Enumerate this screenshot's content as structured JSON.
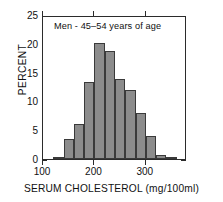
{
  "chart_data": {
    "type": "bar",
    "title": "Men - 45–54 years of age",
    "subtitle": "",
    "xlabel": "SERUM CHOLESTEROL (mg/100ml)",
    "ylabel": "PERCENT",
    "xlim": [
      100,
      380
    ],
    "ylim": [
      0,
      25
    ],
    "grid": false,
    "legend": "none",
    "bin_width": 20,
    "xticks": [
      {
        "value": 100,
        "label": "100"
      },
      {
        "value": 200,
        "label": "200"
      },
      {
        "value": 300,
        "label": "300"
      }
    ],
    "yticks": [
      {
        "value": 0,
        "label": "0"
      },
      {
        "value": 5,
        "label": "5"
      },
      {
        "value": 10,
        "label": "10"
      },
      {
        "value": 15,
        "label": "15"
      },
      {
        "value": 20,
        "label": "20"
      },
      {
        "value": 25,
        "label": "25"
      }
    ],
    "bar_color": "#8c8c8c",
    "bar_edge_color": "#3a3a3a",
    "categories": [
      "120–140",
      "140–160",
      "160–180",
      "180–200",
      "200–220",
      "220–240",
      "240–260",
      "260–280",
      "280–300",
      "300–320",
      "320–340",
      "340–360",
      "360–380"
    ],
    "bins": [
      {
        "start": 120,
        "end": 140,
        "value": 0.4
      },
      {
        "start": 140,
        "end": 160,
        "value": 3.5
      },
      {
        "start": 160,
        "end": 180,
        "value": 6.0
      },
      {
        "start": 180,
        "end": 200,
        "value": 13.4
      },
      {
        "start": 200,
        "end": 220,
        "value": 20.2
      },
      {
        "start": 220,
        "end": 240,
        "value": 18.7
      },
      {
        "start": 240,
        "end": 260,
        "value": 13.9
      },
      {
        "start": 260,
        "end": 280,
        "value": 12.0
      },
      {
        "start": 280,
        "end": 300,
        "value": 8.0
      },
      {
        "start": 300,
        "end": 320,
        "value": 4.0
      },
      {
        "start": 320,
        "end": 340,
        "value": 0.7
      },
      {
        "start": 340,
        "end": 360,
        "value": 0.4
      },
      {
        "start": 360,
        "end": 380,
        "value": 0.0
      }
    ],
    "values": [
      0.4,
      3.5,
      6.0,
      13.4,
      20.2,
      18.7,
      13.9,
      12.0,
      8.0,
      4.0,
      0.7,
      0.4,
      0.0
    ]
  }
}
